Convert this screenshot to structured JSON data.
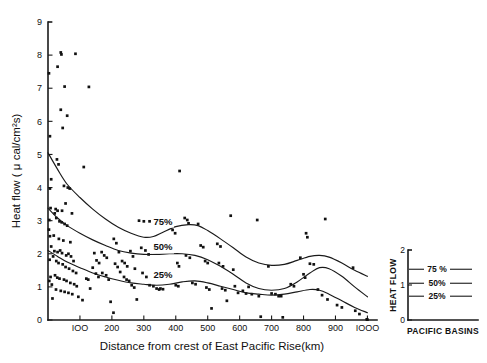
{
  "chart_data": {
    "type": "scatter",
    "title": "",
    "xlabel": "Distance from crest of East Pacific Rise(km)",
    "ylabel": "Heat flow ( μ cal/cm²s)",
    "xlim": [
      0,
      1030
    ],
    "ylim": [
      0,
      9
    ],
    "grid": false,
    "xticks": [
      100,
      200,
      300,
      400,
      500,
      600,
      700,
      800,
      900,
      1000
    ],
    "xtick_labels": [
      "IOO",
      "200",
      "300",
      "400",
      "500",
      "600",
      "700",
      "800",
      "900",
      "IOOO"
    ],
    "yticks": [
      0,
      1,
      2,
      3,
      4,
      5,
      6,
      7,
      8,
      9
    ],
    "ytick_labels": [
      "0",
      "1",
      "2",
      "3",
      "4",
      "5",
      "6",
      "7",
      "8",
      "9"
    ],
    "point_color": "#111111",
    "line_color": "#1a1a1a",
    "scatter": {
      "name": "Heat flow measurements",
      "points": [
        [
          3,
          7.45
        ],
        [
          6,
          5.55
        ],
        [
          10,
          4.25
        ],
        [
          6,
          3.97
        ],
        [
          8,
          3.38
        ],
        [
          4,
          3.02
        ],
        [
          3,
          2.73
        ],
        [
          6,
          2.53
        ],
        [
          10,
          2.22
        ],
        [
          5,
          1.82
        ],
        [
          8,
          1.3
        ],
        [
          4,
          1.18
        ],
        [
          12,
          1.07
        ],
        [
          14,
          0.65
        ],
        [
          30,
          7.65
        ],
        [
          40,
          8.08
        ],
        [
          42,
          8.02
        ],
        [
          86,
          8.04
        ],
        [
          52,
          7.05
        ],
        [
          128,
          7.04
        ],
        [
          40,
          6.35
        ],
        [
          60,
          6.17
        ],
        [
          46,
          5.8
        ],
        [
          28,
          4.85
        ],
        [
          33,
          4.7
        ],
        [
          112,
          4.62
        ],
        [
          50,
          4.05
        ],
        [
          62,
          4.0
        ],
        [
          68,
          3.97
        ],
        [
          24,
          3.35
        ],
        [
          30,
          3.3
        ],
        [
          44,
          3.3
        ],
        [
          55,
          3.52
        ],
        [
          21,
          3.22
        ],
        [
          26,
          3.08
        ],
        [
          36,
          2.98
        ],
        [
          43,
          2.95
        ],
        [
          52,
          2.9
        ],
        [
          60,
          2.85
        ],
        [
          75,
          3.22
        ],
        [
          18,
          2.55
        ],
        [
          34,
          2.45
        ],
        [
          48,
          2.4
        ],
        [
          70,
          2.35
        ],
        [
          20,
          2.08
        ],
        [
          30,
          2.05
        ],
        [
          38,
          2.1
        ],
        [
          44,
          2.02
        ],
        [
          57,
          1.95
        ],
        [
          64,
          2.0
        ],
        [
          72,
          1.92
        ],
        [
          80,
          1.78
        ],
        [
          16,
          1.92
        ],
        [
          26,
          1.78
        ],
        [
          33,
          1.72
        ],
        [
          46,
          1.68
        ],
        [
          55,
          1.6
        ],
        [
          66,
          1.55
        ],
        [
          78,
          1.48
        ],
        [
          88,
          1.42
        ],
        [
          22,
          1.35
        ],
        [
          29,
          1.28
        ],
        [
          36,
          1.25
        ],
        [
          50,
          1.22
        ],
        [
          58,
          1.18
        ],
        [
          70,
          1.12
        ],
        [
          82,
          1.08
        ],
        [
          90,
          1.02
        ],
        [
          25,
          0.92
        ],
        [
          40,
          0.88
        ],
        [
          52,
          0.85
        ],
        [
          64,
          0.82
        ],
        [
          76,
          0.78
        ],
        [
          95,
          0.7
        ],
        [
          108,
          0.6
        ],
        [
          120,
          1.25
        ],
        [
          126,
          1.22
        ],
        [
          132,
          0.95
        ],
        [
          145,
          2.02
        ],
        [
          152,
          1.8
        ],
        [
          160,
          1.72
        ],
        [
          140,
          1.58
        ],
        [
          150,
          1.4
        ],
        [
          158,
          1.3
        ],
        [
          168,
          2.05
        ],
        [
          176,
          1.95
        ],
        [
          184,
          1.88
        ],
        [
          170,
          1.42
        ],
        [
          182,
          1.35
        ],
        [
          190,
          1.22
        ],
        [
          196,
          0.55
        ],
        [
          205,
          0.22
        ],
        [
          206,
          2.45
        ],
        [
          214,
          2.32
        ],
        [
          222,
          2.05
        ],
        [
          210,
          1.7
        ],
        [
          218,
          1.6
        ],
        [
          226,
          1.45
        ],
        [
          232,
          1.78
        ],
        [
          240,
          1.72
        ],
        [
          248,
          1.62
        ],
        [
          238,
          1.3
        ],
        [
          246,
          1.22
        ],
        [
          254,
          1.18
        ],
        [
          258,
          2.08
        ],
        [
          266,
          1.92
        ],
        [
          272,
          1.55
        ],
        [
          262,
          1.05
        ],
        [
          270,
          0.98
        ],
        [
          278,
          0.62
        ],
        [
          285,
          3.0
        ],
        [
          300,
          2.98
        ],
        [
          318,
          2.98
        ],
        [
          292,
          2.18
        ],
        [
          305,
          2.1
        ],
        [
          315,
          1.98
        ],
        [
          296,
          1.42
        ],
        [
          308,
          1.3
        ],
        [
          318,
          1.05
        ],
        [
          330,
          1.02
        ],
        [
          340,
          0.95
        ],
        [
          348,
          0.92
        ],
        [
          352,
          0.95
        ],
        [
          360,
          0.93
        ],
        [
          390,
          2.72
        ],
        [
          398,
          2.62
        ],
        [
          405,
          1.72
        ],
        [
          410,
          1.62
        ],
        [
          412,
          4.5
        ],
        [
          400,
          1.05
        ],
        [
          408,
          1.02
        ],
        [
          428,
          3.08
        ],
        [
          436,
          3.02
        ],
        [
          440,
          2.92
        ],
        [
          432,
          1.95
        ],
        [
          444,
          1.88
        ],
        [
          452,
          1.12
        ],
        [
          462,
          1.08
        ],
        [
          470,
          2.9
        ],
        [
          478,
          2.25
        ],
        [
          486,
          2.2
        ],
        [
          492,
          1.78
        ],
        [
          500,
          1.72
        ],
        [
          496,
          0.98
        ],
        [
          505,
          0.92
        ],
        [
          512,
          0.35
        ],
        [
          530,
          2.3
        ],
        [
          540,
          2.22
        ],
        [
          535,
          1.72
        ],
        [
          548,
          1.62
        ],
        [
          545,
          0.95
        ],
        [
          555,
          0.9
        ],
        [
          560,
          0.58
        ],
        [
          572,
          3.15
        ],
        [
          580,
          1.52
        ],
        [
          585,
          1.02
        ],
        [
          595,
          0.82
        ],
        [
          610,
          0.88
        ],
        [
          620,
          0.8
        ],
        [
          628,
          1.0
        ],
        [
          638,
          0.78
        ],
        [
          655,
          3.02
        ],
        [
          660,
          0.72
        ],
        [
          666,
          0.1
        ],
        [
          690,
          1.62
        ],
        [
          700,
          0.8
        ],
        [
          712,
          0.78
        ],
        [
          722,
          0.72
        ],
        [
          730,
          0.72
        ],
        [
          735,
          0.08
        ],
        [
          760,
          1.08
        ],
        [
          770,
          1.02
        ],
        [
          790,
          1.88
        ],
        [
          800,
          1.38
        ],
        [
          805,
          1.28
        ],
        [
          808,
          2.62
        ],
        [
          812,
          2.5
        ],
        [
          820,
          1.7
        ],
        [
          832,
          1.68
        ],
        [
          845,
          0.92
        ],
        [
          858,
          0.75
        ],
        [
          868,
          3.05
        ],
        [
          875,
          0.62
        ],
        [
          905,
          0.45
        ],
        [
          920,
          0.38
        ],
        [
          955,
          1.58
        ],
        [
          962,
          0.28
        ],
        [
          975,
          0.18
        ],
        [
          998,
          0.02
        ],
        [
          1000,
          0.01
        ]
      ]
    },
    "percentile_curves": [
      {
        "name": "75%",
        "label": "75%",
        "label_x": 360,
        "label_y": 2.88,
        "points": [
          [
            0,
            5.05
          ],
          [
            30,
            4.55
          ],
          [
            60,
            4.1
          ],
          [
            100,
            3.7
          ],
          [
            140,
            3.35
          ],
          [
            180,
            3.05
          ],
          [
            220,
            2.8
          ],
          [
            260,
            2.62
          ],
          [
            300,
            2.5
          ],
          [
            330,
            2.52
          ],
          [
            360,
            2.65
          ],
          [
            400,
            2.82
          ],
          [
            440,
            2.88
          ],
          [
            470,
            2.85
          ],
          [
            500,
            2.7
          ],
          [
            540,
            2.45
          ],
          [
            580,
            2.18
          ],
          [
            620,
            1.9
          ],
          [
            660,
            1.72
          ],
          [
            700,
            1.65
          ],
          [
            740,
            1.68
          ],
          [
            780,
            1.8
          ],
          [
            820,
            1.92
          ],
          [
            850,
            1.95
          ],
          [
            880,
            1.9
          ],
          [
            920,
            1.72
          ],
          [
            960,
            1.5
          ],
          [
            1000,
            1.32
          ]
        ]
      },
      {
        "name": "50%",
        "label": "50%",
        "label_x": 360,
        "label_y": 2.1,
        "points": [
          [
            0,
            3.38
          ],
          [
            30,
            3.08
          ],
          [
            60,
            2.85
          ],
          [
            100,
            2.62
          ],
          [
            140,
            2.42
          ],
          [
            180,
            2.25
          ],
          [
            220,
            2.1
          ],
          [
            260,
            2.02
          ],
          [
            300,
            1.98
          ],
          [
            340,
            1.98
          ],
          [
            380,
            2.0
          ],
          [
            420,
            2.0
          ],
          [
            460,
            1.95
          ],
          [
            500,
            1.82
          ],
          [
            540,
            1.62
          ],
          [
            580,
            1.38
          ],
          [
            620,
            1.12
          ],
          [
            660,
            0.95
          ],
          [
            700,
            0.9
          ],
          [
            740,
            0.95
          ],
          [
            780,
            1.15
          ],
          [
            820,
            1.42
          ],
          [
            850,
            1.58
          ],
          [
            880,
            1.55
          ],
          [
            920,
            1.32
          ],
          [
            960,
            1.0
          ],
          [
            1000,
            0.7
          ]
        ]
      },
      {
        "name": "25%",
        "label": "25%",
        "label_x": 360,
        "label_y": 1.28,
        "points": [
          [
            0,
            2.1
          ],
          [
            30,
            1.92
          ],
          [
            60,
            1.75
          ],
          [
            100,
            1.58
          ],
          [
            140,
            1.42
          ],
          [
            180,
            1.3
          ],
          [
            220,
            1.2
          ],
          [
            260,
            1.12
          ],
          [
            300,
            1.08
          ],
          [
            340,
            1.05
          ],
          [
            380,
            1.08
          ],
          [
            420,
            1.15
          ],
          [
            460,
            1.18
          ],
          [
            500,
            1.12
          ],
          [
            540,
            1.02
          ],
          [
            580,
            0.92
          ],
          [
            620,
            0.82
          ],
          [
            660,
            0.78
          ],
          [
            700,
            0.75
          ],
          [
            740,
            0.78
          ],
          [
            780,
            0.85
          ],
          [
            820,
            0.92
          ],
          [
            850,
            0.9
          ],
          [
            880,
            0.78
          ],
          [
            920,
            0.58
          ],
          [
            960,
            0.38
          ],
          [
            1000,
            0.22
          ]
        ]
      }
    ]
  },
  "inset": {
    "axis_title": "HEAT FLOW",
    "caption": "PACIFIC BASINS",
    "yticks": [
      0,
      1,
      2
    ],
    "ytick_labels": [
      "0",
      "1",
      "2"
    ],
    "series": [
      {
        "label": "75 %",
        "value": 1.45
      },
      {
        "label": "50%",
        "value": 1.05
      },
      {
        "label": "25%",
        "value": 0.68
      }
    ]
  }
}
